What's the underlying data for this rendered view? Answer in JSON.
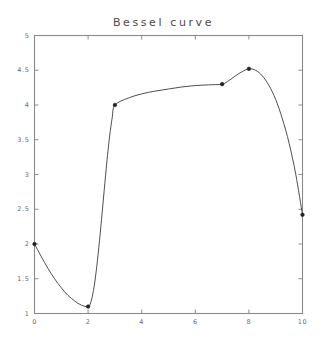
{
  "figure": {
    "title": "Bessel curve",
    "background_color": "#ffffff",
    "frame_color": "#8a8a8a",
    "curve_color": "#3a3a3a",
    "marker_color": "#222222",
    "tick_label_color": "#6b6b6b",
    "title_color": "#4a4a4a"
  },
  "axes": {
    "x_ticks": [
      "0",
      "2",
      "4",
      "6",
      "8",
      "10"
    ],
    "x_tick_values": [
      0,
      2,
      4,
      6,
      8,
      10
    ],
    "y_ticks": [
      "1",
      "1.5",
      "2",
      "2.5",
      "3",
      "3.5",
      "4",
      "4.5",
      "5"
    ],
    "y_tick_values": [
      1,
      1.5,
      2,
      2.5,
      3,
      3.5,
      4,
      4.5,
      5
    ],
    "xlim": [
      0,
      10
    ],
    "ylim": [
      1,
      5
    ],
    "tick_direction": "in",
    "frame": "box"
  },
  "chart_data": {
    "type": "line",
    "title": "Bessel curve",
    "xlabel": "",
    "ylabel": "",
    "xlim": [
      0,
      10
    ],
    "ylim": [
      1,
      5
    ],
    "grid": false,
    "legend": "none",
    "series": [
      {
        "name": "Bessel curve",
        "style": "interpolated-spline-with-markers",
        "marker": "point",
        "control_points_x": [
          0,
          2,
          3,
          7,
          8,
          10
        ],
        "control_points_y": [
          2.0,
          1.1,
          4.0,
          4.3,
          4.52,
          2.42
        ],
        "x": [
          0,
          0.25,
          0.5,
          0.75,
          1,
          1.25,
          1.5,
          1.75,
          2,
          2.1,
          2.2,
          2.3,
          2.4,
          2.5,
          2.6,
          2.7,
          2.8,
          2.9,
          3,
          3.5,
          4,
          4.5,
          5,
          5.5,
          6,
          6.5,
          7,
          7.25,
          7.5,
          7.75,
          8,
          8.25,
          8.5,
          8.75,
          9,
          9.25,
          9.5,
          9.75,
          10
        ],
        "y": [
          2.0,
          1.82,
          1.65,
          1.5,
          1.37,
          1.26,
          1.18,
          1.12,
          1.1,
          1.16,
          1.33,
          1.6,
          1.95,
          2.35,
          2.77,
          3.18,
          3.54,
          3.82,
          4.0,
          4.1,
          4.16,
          4.2,
          4.23,
          4.26,
          4.28,
          4.29,
          4.3,
          4.35,
          4.42,
          4.48,
          4.52,
          4.5,
          4.42,
          4.28,
          4.08,
          3.8,
          3.45,
          3.0,
          2.42
        ]
      }
    ]
  }
}
